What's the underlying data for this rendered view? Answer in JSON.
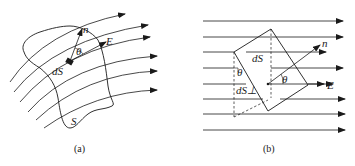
{
  "figure_a": {
    "caption": "(a)",
    "labels": {
      "normal": "n",
      "field": "E",
      "angle": "θ",
      "element": "dS",
      "surface": "S"
    }
  },
  "figure_b": {
    "caption": "(b)",
    "labels": {
      "normal": "n",
      "field": "E",
      "angle_center": "θ",
      "angle_side": "θ",
      "element": "dS",
      "projection": "dS⊥"
    }
  },
  "colors": {
    "ink": "#1a1a1a",
    "background": "#ffffff"
  }
}
